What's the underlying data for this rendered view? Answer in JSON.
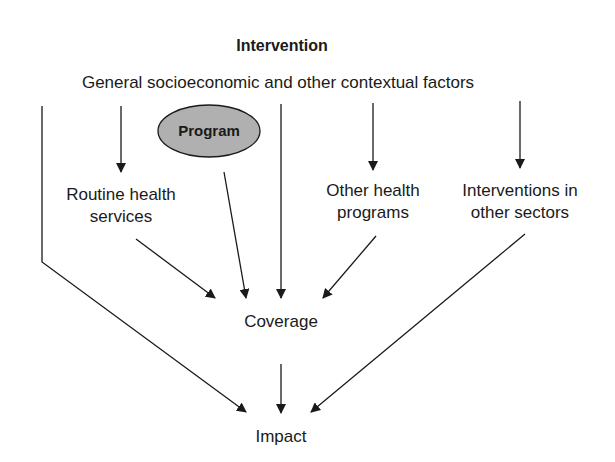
{
  "diagram": {
    "title": "Intervention",
    "context_factors": "General socioeconomic and other contextual factors",
    "program": "Program",
    "routine_health": {
      "line1": "Routine health",
      "line2": "services"
    },
    "other_health": {
      "line1": "Other health",
      "line2": "programs"
    },
    "other_sectors": {
      "line1": "Interventions in",
      "line2": "other sectors"
    },
    "coverage": "Coverage",
    "impact": "Impact",
    "colors": {
      "stroke": "#1a1a1a",
      "program_fill": "#b0b0b0",
      "background": "#ffffff"
    },
    "edges": [
      {
        "from": "General socioeconomic and other contextual factors",
        "to": "Impact"
      },
      {
        "from": "General socioeconomic and other contextual factors",
        "to": "Routine health services"
      },
      {
        "from": "General socioeconomic and other contextual factors",
        "to": "Coverage"
      },
      {
        "from": "General socioeconomic and other contextual factors",
        "to": "Other health programs"
      },
      {
        "from": "General socioeconomic and other contextual factors",
        "to": "Interventions in other sectors"
      },
      {
        "from": "Program",
        "to": "Coverage"
      },
      {
        "from": "Routine health services",
        "to": "Coverage"
      },
      {
        "from": "Other health programs",
        "to": "Coverage"
      },
      {
        "from": "Interventions in other sectors",
        "to": "Impact"
      },
      {
        "from": "Coverage",
        "to": "Impact"
      }
    ]
  }
}
